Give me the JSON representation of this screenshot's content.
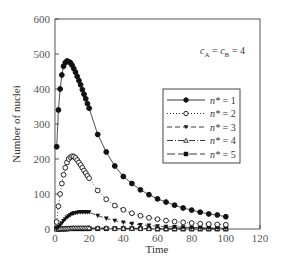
{
  "chart_data": {
    "type": "line",
    "title": "",
    "xlabel": "Time",
    "ylabel": "Number of nuclei",
    "xlim": [
      0,
      120
    ],
    "ylim": [
      0,
      600
    ],
    "xticks": [
      0,
      20,
      40,
      60,
      80,
      100,
      120
    ],
    "yticks": [
      0,
      100,
      200,
      300,
      400,
      500,
      600
    ],
    "grid": false,
    "legend_position": "center-right",
    "annotation": "c_A = c_B = 4",
    "annotation_parts": {
      "c1": "c",
      "s1": "A",
      "eq1": " = ",
      "c2": "c",
      "s2": "B",
      "eq2": " = 4"
    },
    "series": [
      {
        "name": "n* = 1",
        "label_var": "n*",
        "label_val": "= 1",
        "marker": "filled-circle",
        "line": "solid",
        "x": [
          1,
          2,
          3,
          4,
          5,
          6,
          7,
          8,
          9,
          10,
          11,
          12,
          13,
          14,
          15,
          16,
          17,
          18,
          19,
          20,
          25,
          30,
          35,
          40,
          45,
          50,
          55,
          60,
          65,
          70,
          75,
          80,
          85,
          90,
          95,
          100
        ],
        "y": [
          235,
          340,
          400,
          440,
          465,
          475,
          480,
          478,
          475,
          468,
          458,
          448,
          436,
          424,
          412,
          398,
          385,
          372,
          358,
          345,
          270,
          220,
          180,
          150,
          130,
          112,
          98,
          86,
          77,
          68,
          60,
          54,
          48,
          43,
          40,
          35
        ]
      },
      {
        "name": "n* = 2",
        "label_var": "n*",
        "label_val": "= 2",
        "marker": "open-circle",
        "line": "dotted",
        "x": [
          1,
          2,
          3,
          4,
          5,
          6,
          7,
          8,
          9,
          10,
          11,
          12,
          13,
          14,
          15,
          16,
          17,
          18,
          19,
          20,
          25,
          30,
          35,
          40,
          45,
          50,
          55,
          60,
          65,
          70,
          75,
          80,
          85,
          90,
          95,
          100
        ],
        "y": [
          20,
          65,
          100,
          130,
          155,
          175,
          190,
          200,
          205,
          208,
          207,
          203,
          197,
          190,
          183,
          175,
          167,
          160,
          152,
          145,
          110,
          85,
          67,
          55,
          45,
          38,
          32,
          28,
          24,
          21,
          19,
          17,
          15,
          14,
          13,
          12
        ]
      },
      {
        "name": "n* = 3",
        "label_var": "n*",
        "label_val": "= 3",
        "marker": "filled-triangle-down",
        "line": "dashed",
        "x": [
          1,
          2,
          3,
          4,
          5,
          6,
          7,
          8,
          9,
          10,
          11,
          12,
          13,
          14,
          15,
          16,
          17,
          18,
          19,
          20,
          25,
          30,
          35,
          40,
          45,
          50,
          55,
          60,
          65,
          70,
          75,
          80,
          85,
          90,
          95,
          100
        ],
        "y": [
          2,
          6,
          11,
          17,
          23,
          28,
          33,
          37,
          40,
          43,
          45,
          46,
          47,
          48,
          48,
          48,
          48,
          48,
          48,
          48,
          38,
          30,
          24,
          19,
          15,
          12,
          10,
          8,
          7,
          6,
          5,
          4,
          4,
          3,
          3,
          3
        ]
      },
      {
        "name": "n* = 4",
        "label_var": "n*",
        "label_val": "= 4",
        "marker": "open-triangle-up",
        "line": "dash-dot",
        "x": [
          1,
          2,
          3,
          4,
          5,
          6,
          7,
          8,
          9,
          10,
          11,
          12,
          13,
          14,
          15,
          16,
          17,
          18,
          19,
          20,
          25,
          30,
          35,
          40,
          45,
          50,
          55,
          60,
          65,
          70,
          75,
          80,
          85,
          90,
          95,
          100
        ],
        "y": [
          0,
          0,
          1,
          1,
          1,
          2,
          2,
          2,
          2,
          3,
          3,
          3,
          3,
          3,
          3,
          3,
          3,
          3,
          3,
          3,
          3,
          3,
          2,
          2,
          2,
          2,
          1,
          1,
          1,
          1,
          1,
          1,
          1,
          1,
          1,
          1
        ]
      },
      {
        "name": "n* = 5",
        "label_var": "n*",
        "label_val": "= 5",
        "marker": "filled-square",
        "line": "long-dash",
        "x": [
          1,
          2,
          3,
          4,
          5,
          6,
          7,
          8,
          9,
          10,
          11,
          12,
          13,
          14,
          15,
          16,
          17,
          18,
          19,
          20,
          25,
          30,
          35,
          40,
          45,
          50,
          55,
          60,
          65,
          70,
          75,
          80,
          85,
          90,
          95,
          100
        ],
        "y": [
          0,
          0,
          0,
          0,
          0,
          0,
          0,
          1,
          1,
          1,
          1,
          1,
          1,
          1,
          1,
          1,
          1,
          1,
          1,
          1,
          1,
          1,
          1,
          1,
          1,
          1,
          1,
          0,
          0,
          0,
          0,
          0,
          0,
          0,
          0,
          0
        ]
      }
    ]
  }
}
